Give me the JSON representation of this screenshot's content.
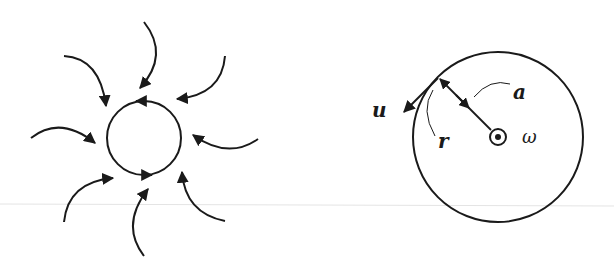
{
  "colors": {
    "stroke": "#1a1a1a",
    "background": "#ffffff",
    "baseline": "#e4e4e4"
  },
  "left_diagram": {
    "description": "Vortex with inward-spiraling flow lines converging on a circular core with counter-clockwise circulation",
    "core_circle": {
      "cx": 144,
      "cy": 138,
      "r": 37
    },
    "inflow_arrow_count": 8
  },
  "right_diagram": {
    "description": "Rotating disk of radius a with angular velocity out of page; tangential velocity u at radius r",
    "circle": {
      "cx": 498,
      "cy": 137,
      "r": 85
    },
    "labels": {
      "velocity": "u",
      "radius_arc": "r",
      "radius": "a",
      "angular_velocity": "ω"
    }
  }
}
